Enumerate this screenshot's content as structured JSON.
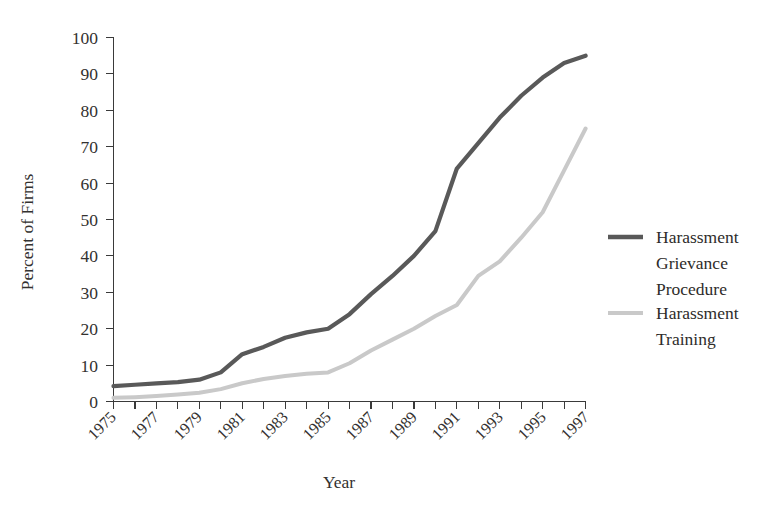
{
  "chart_data": {
    "type": "line",
    "title": "",
    "xlabel": "Year",
    "ylabel": "Percent of Firms",
    "xlim": [
      1975,
      1997
    ],
    "ylim": [
      0,
      100
    ],
    "grid": false,
    "legend_position": "right",
    "x": [
      1975,
      1976,
      1977,
      1978,
      1979,
      1980,
      1981,
      1982,
      1983,
      1984,
      1985,
      1986,
      1987,
      1988,
      1989,
      1990,
      1991,
      1992,
      1993,
      1994,
      1995,
      1996,
      1997
    ],
    "xtick_labels": [
      "1975",
      "1977",
      "1979",
      "1981",
      "1983",
      "1985",
      "1987",
      "1989",
      "1991",
      "1993",
      "1995",
      "1997"
    ],
    "xtick_values": [
      1975,
      1977,
      1979,
      1981,
      1983,
      1985,
      1987,
      1989,
      1991,
      1993,
      1995,
      1997
    ],
    "ytick_labels": [
      "0",
      "10",
      "20",
      "30",
      "40",
      "50",
      "60",
      "70",
      "80",
      "90",
      "100"
    ],
    "ytick_values": [
      0,
      10,
      20,
      30,
      40,
      50,
      60,
      70,
      80,
      90,
      100
    ],
    "series": [
      {
        "name": "Harassment Grievance Procedure",
        "color": "#595959",
        "width": 4.2,
        "values": [
          4.2,
          4.6,
          5.0,
          5.3,
          6.0,
          8.0,
          13.0,
          15.0,
          17.5,
          19.0,
          20.0,
          24.0,
          29.5,
          34.5,
          40.0,
          46.8,
          64.0,
          71.0,
          78.0,
          84.0,
          89.0,
          93.0,
          95.0
        ]
      },
      {
        "name": "Harassment Training",
        "color": "#c9c9c9",
        "width": 4.0,
        "values": [
          1.0,
          1.2,
          1.5,
          1.9,
          2.4,
          3.4,
          5.0,
          6.2,
          7.0,
          7.6,
          8.0,
          10.5,
          14.0,
          17.0,
          20.0,
          23.5,
          26.5,
          34.5,
          38.5,
          45.0,
          52.0,
          63.5,
          75.0
        ]
      }
    ],
    "annotations": []
  },
  "legend": {
    "entries": [
      {
        "label_lines": [
          "Harassment",
          "Grievance",
          "Procedure"
        ],
        "color": "#595959"
      },
      {
        "label_lines": [
          "Harassment",
          "Training"
        ],
        "color": "#c9c9c9"
      }
    ]
  },
  "legend_text": {
    "e0l0": "Harassment",
    "e0l1": "Grievance",
    "e0l2": "Procedure",
    "e1l0": "Harassment",
    "e1l1": "Training"
  },
  "ylabels": {
    "t0": "0",
    "t1": "10",
    "t2": "20",
    "t3": "30",
    "t4": "40",
    "t5": "50",
    "t6": "60",
    "t7": "70",
    "t8": "80",
    "t9": "90",
    "t10": "100"
  },
  "xlabels": {
    "t0": "1975",
    "t1": "1977",
    "t2": "1979",
    "t3": "1981",
    "t4": "1983",
    "t5": "1985",
    "t6": "1987",
    "t7": "1989",
    "t8": "1991",
    "t9": "1993",
    "t10": "1995",
    "t11": "1997"
  },
  "axis_titles": {
    "x": "Year",
    "y": "Percent of Firms"
  }
}
